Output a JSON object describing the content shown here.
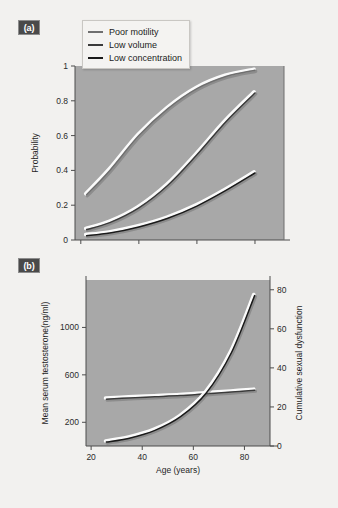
{
  "figure": {
    "background": "#f2f1ef",
    "plot_background": "#a8a8a8"
  },
  "panels": [
    {
      "id": "a",
      "label": "(a)",
      "legend": {
        "position": "top-left-inside",
        "entries": [
          {
            "label": "Poor motility",
            "color": "#6f6f6f"
          },
          {
            "label": "Low volume",
            "color": "#3a3a3a"
          },
          {
            "label": "Low concentration",
            "color": "#1a1a1a"
          }
        ]
      }
    },
    {
      "id": "b",
      "label": "(b)"
    }
  ],
  "chart_data": [
    {
      "type": "line",
      "panel": "(a)",
      "title": "",
      "xlabel": "Age (years)",
      "ylabel": "Probability",
      "xlim": [
        18,
        90
      ],
      "ylim": [
        0,
        1
      ],
      "xticks": [
        20,
        40,
        60,
        80
      ],
      "yticks": [
        0,
        0.2,
        0.4,
        0.6,
        0.8,
        1
      ],
      "ytick_labels": [
        "0",
        "0.2",
        "0.4",
        "0.6",
        "0.8",
        "1"
      ],
      "grid": false,
      "legend_position": "upper left",
      "x": [
        22,
        30,
        40,
        50,
        60,
        70,
        80
      ],
      "series": [
        {
          "name": "Poor motility",
          "color": "#6f6f6f",
          "values": [
            0.26,
            0.4,
            0.6,
            0.755,
            0.87,
            0.94,
            0.975
          ]
        },
        {
          "name": "Low volume",
          "color": "#3a3a3a",
          "values": [
            0.06,
            0.1,
            0.185,
            0.315,
            0.49,
            0.68,
            0.845
          ]
        },
        {
          "name": "Low concentration",
          "color": "#1a1a1a",
          "values": [
            0.025,
            0.04,
            0.075,
            0.125,
            0.195,
            0.285,
            0.385
          ]
        }
      ]
    },
    {
      "type": "line",
      "panel": "(b)",
      "title": "",
      "xlabel": "Age (years)",
      "ylabel": "Mean serum testosterone(ng/ml)",
      "y2label": "Cumulative sexual dysfunction",
      "xlim": [
        18,
        90
      ],
      "ylim": [
        0,
        1400
      ],
      "y2lim": [
        0,
        85
      ],
      "xticks": [
        20,
        40,
        60,
        80
      ],
      "yticks": [
        200,
        600,
        1000
      ],
      "ytick_labels": [
        "200",
        "600",
        "1000"
      ],
      "y2ticks": [
        0,
        20,
        40,
        60,
        80
      ],
      "y2tick_labels": [
        "0",
        "20",
        "40",
        "60",
        "80"
      ],
      "grid": false,
      "x": [
        26,
        35,
        45,
        55,
        65,
        75,
        84
      ],
      "series": [
        {
          "name": "Mean serum testosterone",
          "axis": "left",
          "color": "#3a3a3a",
          "values": [
            395,
            405,
            415,
            425,
            440,
            455,
            470
          ]
        },
        {
          "name": "Cumulative sexual dysfunction",
          "axis": "right",
          "color": "#1a1a1a",
          "values": [
            2,
            4,
            8,
            15,
            27,
            48,
            77
          ]
        }
      ]
    }
  ]
}
